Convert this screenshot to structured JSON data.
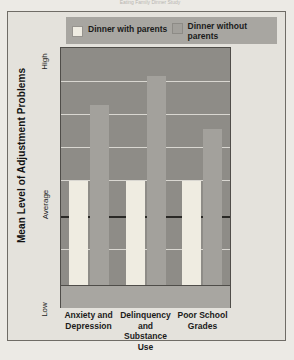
{
  "caption": "Eating Family Dinner Study",
  "legend": {
    "items": [
      {
        "label": "Dinner with parents",
        "color": "#efece1",
        "key": "with"
      },
      {
        "label": "Dinner without parents",
        "color": "#a3a19c",
        "key": "without"
      }
    ]
  },
  "axis": {
    "y_title": "Mean Level of Adjustment Problems",
    "y_ticks": [
      "High",
      "Average",
      "Low"
    ]
  },
  "chart_data": {
    "type": "bar",
    "title": "Eating Family Dinner Study",
    "xlabel": "",
    "ylabel": "Mean Level of Adjustment Problems",
    "categories": [
      "Anxiety and Depression",
      "Delinquency and Substance Use",
      "Poor School Grades"
    ],
    "ytick_labels": [
      "Low",
      "Average",
      "High"
    ],
    "ytick_values": [
      0,
      50,
      100
    ],
    "ylim": [
      0,
      100
    ],
    "grid": true,
    "legend_position": "top",
    "series": [
      {
        "name": "Dinner with parents",
        "color": "#efece1",
        "values": [
          44,
          44,
          44
        ]
      },
      {
        "name": "Dinner without parents",
        "color": "#a3a19c",
        "values": [
          76,
          88,
          66
        ]
      }
    ],
    "annotations": [
      "Average reference line drawn across the plot at the 'Average' level"
    ]
  }
}
